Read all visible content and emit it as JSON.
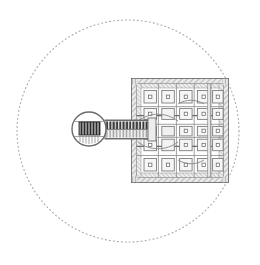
{
  "figure": {
    "type": "technical-line-drawing",
    "caption": "",
    "background_color": "#ffffff",
    "canvas": {
      "width": 260,
      "height": 265
    }
  },
  "boundary_circle": {
    "name": "boundary-circle",
    "style": "dotted",
    "center_x": 128,
    "center_y": 131,
    "radius": 111,
    "stroke_color": "#a8a8a8",
    "stroke_width": 1,
    "dash_pattern": "1 3"
  },
  "grid_block": {
    "name": "grid-array",
    "x": 131,
    "y": 78,
    "width": 98,
    "height": 105,
    "rows": 5,
    "columns": 5,
    "cell_fill": "#f2f2f2",
    "cell_stroke": "#8c8c8c",
    "frame_fill": "#d4d4d4",
    "frame_stroke": "#707070",
    "center_dot_fill": "#ffffff",
    "center_dot_stroke": "#6e6e6e",
    "hatch_color": "#9a9a9a"
  },
  "key_head": {
    "name": "key-head-circle",
    "center_x": 89,
    "center_y": 129,
    "radius": 17,
    "stroke_color": "#6b6b6b",
    "stroke_width": 1.4,
    "inner_block": {
      "x": 79,
      "y": 122,
      "width": 21,
      "height": 13,
      "fill": "#2a2a2a",
      "stripe_color": "#ffffff",
      "stripe_count": 7
    }
  },
  "key_shaft": {
    "name": "key-shaft",
    "x": 105,
    "y": 120,
    "width": 46,
    "height": 19,
    "fill": "#ededed",
    "stroke": "#7a7a7a",
    "tooth_count": 14,
    "tooth_fill": "#3a3a3a",
    "tooth_width": 2.2,
    "tooth_height": 6
  },
  "colors": {
    "ink_dark": "#2a2a2a",
    "ink_mid": "#7a7a7a",
    "ink_light": "#b8b8b8",
    "paper": "#ffffff"
  },
  "accessibility": {
    "figure_alt": "Grayscale technical drawing of a key-shaped structure: a circular head with a dark striped block, a toothed shaft, and a five-by-five square grid array, all enclosed by a large dotted circle."
  }
}
